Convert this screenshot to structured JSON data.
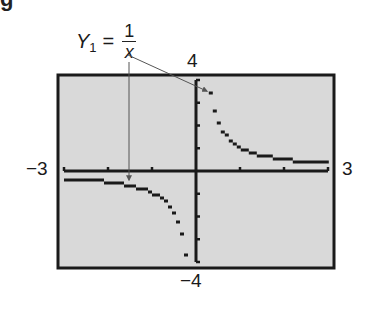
{
  "figure": {
    "equation": {
      "lhs": "Y",
      "subscript": "1",
      "equals": "=",
      "numerator": "1",
      "denominator": "x"
    },
    "window_labels": {
      "ymax": "4",
      "ymin": "−4",
      "xmin": "−3",
      "xmax": "3"
    },
    "colors": {
      "screen_bg": "#d9d9d9",
      "ink": "#1a1a1a",
      "arrow": "#555555"
    }
  },
  "chart_data": {
    "type": "line",
    "title": "",
    "function": "Y1 = 1/x",
    "xlabel": "",
    "ylabel": "",
    "xlim": [
      -3,
      3
    ],
    "ylim": [
      -4,
      4
    ],
    "xscl": 1,
    "yscl": 1,
    "grid": false,
    "annotations": [
      {
        "text": "Y1 = 1/x",
        "points_to": [
          [
            0.3,
            3.33
          ],
          [
            -1.5,
            -0.67
          ]
        ]
      }
    ],
    "series": [
      {
        "name": "Y1 = 1/x (x<0)",
        "x": [
          -3,
          -2.5,
          -2,
          -1.5,
          -1.25,
          -1,
          -0.8,
          -0.6,
          -0.5,
          -0.4,
          -0.3,
          -0.25
        ],
        "y": [
          -0.33,
          -0.4,
          -0.5,
          -0.67,
          -0.8,
          -1,
          -1.25,
          -1.67,
          -2,
          -2.5,
          -3.33,
          -4
        ]
      },
      {
        "name": "Y1 = 1/x (x>0)",
        "x": [
          0.25,
          0.3,
          0.4,
          0.5,
          0.6,
          0.8,
          1,
          1.25,
          1.5,
          2,
          2.5,
          3
        ],
        "y": [
          4,
          3.33,
          2.5,
          2,
          1.67,
          1.25,
          1,
          0.8,
          0.67,
          0.5,
          0.4,
          0.33
        ]
      }
    ]
  }
}
